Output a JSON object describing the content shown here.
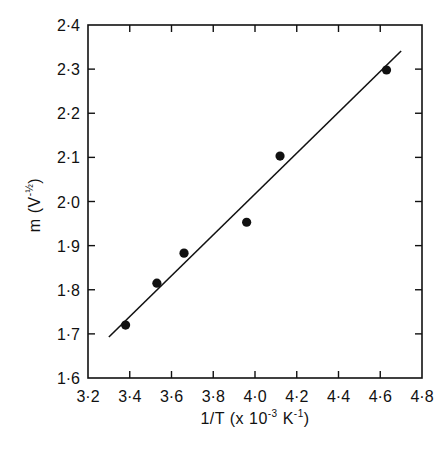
{
  "chart_data": {
    "type": "scatter",
    "title": "",
    "xlabel": "1/T  (x 10^-3 K^-1)",
    "ylabel": "m  (V^-1/2)",
    "xlim": [
      3.2,
      4.8
    ],
    "ylim": [
      1.6,
      2.4
    ],
    "x_ticks": [
      3.2,
      3.4,
      3.6,
      3.8,
      4.0,
      4.2,
      4.4,
      4.6,
      4.8
    ],
    "y_ticks": [
      1.6,
      1.7,
      1.8,
      1.9,
      2.0,
      2.1,
      2.2,
      2.3,
      2.4
    ],
    "x_tick_labels": [
      "3·2",
      "3·4",
      "3·6",
      "3·8",
      "4·0",
      "4·2",
      "4·4",
      "4·6",
      "4·8"
    ],
    "y_tick_labels": [
      "1·6",
      "1·7",
      "1·8",
      "1·9",
      "2·0",
      "2·1",
      "2·2",
      "2·3",
      "2·4"
    ],
    "grid": false,
    "legend": null,
    "series": [
      {
        "name": "measured",
        "kind": "scatter",
        "marker": "filled-circle",
        "x": [
          3.38,
          3.53,
          3.66,
          3.96,
          4.12,
          4.63
        ],
        "y": [
          1.72,
          1.815,
          1.883,
          1.953,
          2.103,
          2.298
        ]
      },
      {
        "name": "linear fit",
        "kind": "line",
        "x": [
          3.3,
          4.7
        ],
        "y": [
          1.693,
          2.341
        ]
      }
    ]
  },
  "labels": {
    "xlabel_main": "1/T  (x 10",
    "xlabel_exp": "-3",
    "xlabel_unit": " K",
    "xlabel_unit_exp": "-1",
    "xlabel_close": ")",
    "ylabel_main": "m  (V",
    "ylabel_exp": "-½",
    "ylabel_close": ")"
  },
  "colors": {
    "ink": "#111111",
    "background": "#ffffff"
  }
}
